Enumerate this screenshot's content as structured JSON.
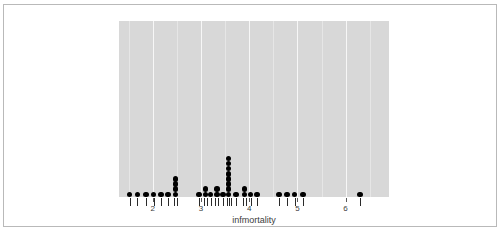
{
  "figure": {
    "background_color": "#ffffff",
    "border_color": "#b9b9b9",
    "panel_color": "#d8d8d8",
    "dot_color": "#000000",
    "gridline_color": "#f7f7f7"
  },
  "chart_data": {
    "type": "scatter",
    "plot_style": "dotplot-with-rug",
    "title": "",
    "subtitle": "",
    "xlabel": "infmortality",
    "ylabel": "",
    "xlim": [
      1.3,
      6.9
    ],
    "ylim": [
      0,
      11
    ],
    "grid": true,
    "legend": null,
    "xticks": [
      2,
      3,
      4,
      5,
      6
    ],
    "xticklabels": [
      "2",
      "3",
      "4",
      "5",
      "6"
    ],
    "dot_diameter_units": 0.115,
    "stacks": [
      {
        "x": 1.52,
        "count": 1
      },
      {
        "x": 1.68,
        "count": 1
      },
      {
        "x": 1.86,
        "count": 1
      },
      {
        "x": 2.02,
        "count": 1
      },
      {
        "x": 2.17,
        "count": 1
      },
      {
        "x": 2.32,
        "count": 1
      },
      {
        "x": 2.47,
        "count": 4
      },
      {
        "x": 2.96,
        "count": 1
      },
      {
        "x": 3.09,
        "count": 2
      },
      {
        "x": 3.2,
        "count": 1
      },
      {
        "x": 3.33,
        "count": 2
      },
      {
        "x": 3.46,
        "count": 1
      },
      {
        "x": 3.57,
        "count": 8
      },
      {
        "x": 3.73,
        "count": 1
      },
      {
        "x": 3.9,
        "count": 2
      },
      {
        "x": 4.03,
        "count": 1
      },
      {
        "x": 4.16,
        "count": 1
      },
      {
        "x": 4.62,
        "count": 1
      },
      {
        "x": 4.78,
        "count": 1
      },
      {
        "x": 4.94,
        "count": 1
      },
      {
        "x": 5.12,
        "count": 1
      },
      {
        "x": 6.3,
        "count": 1
      }
    ],
    "rug_values": [
      1.52,
      1.68,
      1.86,
      2.02,
      2.17,
      2.32,
      2.44,
      2.5,
      2.96,
      3.06,
      3.12,
      3.2,
      3.3,
      3.36,
      3.46,
      3.53,
      3.58,
      3.63,
      3.73,
      3.87,
      3.93,
      4.03,
      4.16,
      4.62,
      4.78,
      4.94,
      5.12,
      6.3
    ],
    "n_observations": 36
  }
}
